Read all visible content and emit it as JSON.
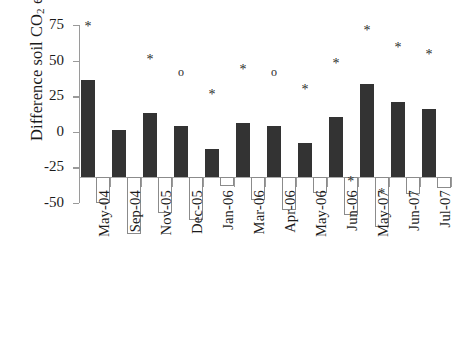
{
  "chart_data": {
    "type": "bar",
    "title": "",
    "xlabel": "",
    "ylabel": "Difference soil CO2 efflux (%)",
    "ylabel_parts": {
      "pre": "Difference soil CO",
      "sub": "2",
      "post": " efflux (%)"
    },
    "ylim": [
      -50,
      75
    ],
    "yticks": [
      75,
      50,
      25,
      0,
      -25,
      -50
    ],
    "ytick_labels": [
      "75",
      "50",
      "25",
      "0",
      "-25",
      "-50"
    ],
    "grid": false,
    "legend": "none",
    "categories": [
      "May-04",
      "Sep-04",
      "Nov-05",
      "Dec-05",
      "Jan-06",
      "Mar-06",
      "Apr-06",
      "May-06",
      "Jun-06",
      "May-07",
      "Jun-07",
      "Jul-07"
    ],
    "series": [
      {
        "name": "Positive difference",
        "fill": "#333333",
        "style": "filled",
        "values": [
          68,
          33,
          45,
          36,
          20,
          38,
          36,
          24,
          42,
          65,
          53,
          48
        ],
        "markers": [
          "*",
          "",
          "*",
          "o",
          "*",
          "*",
          "o",
          "*",
          "*",
          "*",
          "*",
          "*"
        ]
      },
      {
        "name": "Negative difference",
        "fill": "#ffffff",
        "style": "open",
        "values": [
          -18,
          -40,
          -25,
          -30,
          -6,
          -16,
          -23,
          -11,
          -27,
          -35,
          -12,
          -8
        ],
        "markers": [
          "",
          "",
          "",
          "",
          "",
          "",
          "",
          "",
          "*",
          "*",
          "",
          ""
        ]
      }
    ],
    "marker_symbols": {
      "significant": "*",
      "marginal": "o"
    },
    "colors": {
      "positive_bar": "#333333",
      "negative_bar_border": "#8b8b8b",
      "axis": "#9a9a9a",
      "text": "#1b1b1b",
      "background": "#ffffff"
    }
  }
}
